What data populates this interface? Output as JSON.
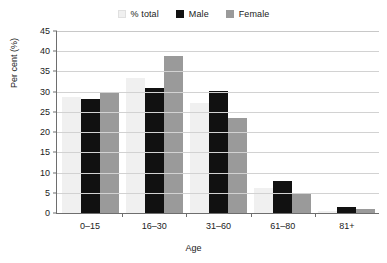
{
  "chart_data": {
    "type": "bar",
    "title": "",
    "xlabel": "Age",
    "ylabel": "Per cent (%)",
    "categories": [
      "0–15",
      "16–30",
      "31–60",
      "61–80",
      "81+"
    ],
    "series": [
      {
        "name": "% total",
        "color": "#f0f0f0",
        "values": [
          28.7,
          33.5,
          27.3,
          6.3,
          0.5
        ]
      },
      {
        "name": "Male",
        "color": "#111111",
        "values": [
          28.2,
          30.8,
          30.1,
          8.0,
          1.6
        ]
      },
      {
        "name": "Female",
        "color": "#9a9a9a",
        "values": [
          30.0,
          38.7,
          23.6,
          4.9,
          0.9
        ]
      }
    ],
    "ylim": [
      0,
      45
    ],
    "ytick_step": 5,
    "yticks": [
      "0",
      "5",
      "10",
      "15",
      "20",
      "25",
      "30",
      "35",
      "40",
      "45"
    ],
    "grid": true,
    "grid_axis": "y",
    "legend_position": "top-center",
    "axis_color": "#6e6e6e",
    "grid_color": "#d2d2d2",
    "background": "#ffffff"
  }
}
